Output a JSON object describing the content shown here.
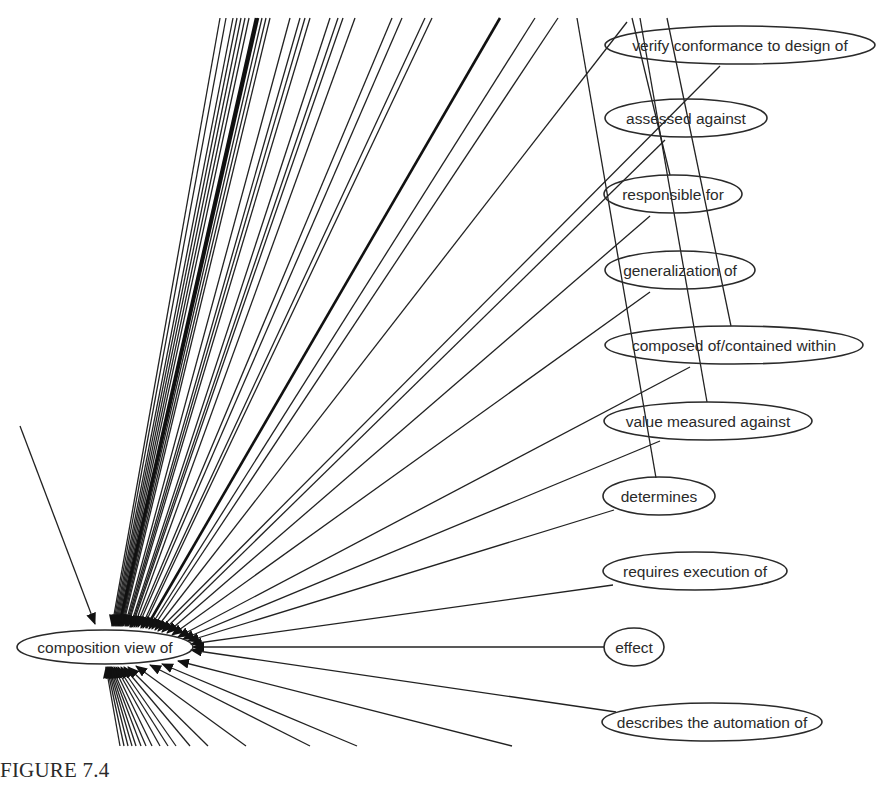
{
  "figure": {
    "caption": "FIGURE 7.4",
    "hub_node": {
      "id": "hub",
      "label": "composition view of",
      "cx": 105,
      "cy": 647,
      "rx": 88,
      "ry": 17
    },
    "nodes": [
      {
        "id": "verify",
        "label": "verify conformance to design of",
        "cx": 740,
        "cy": 45,
        "rx": 135,
        "ry": 19
      },
      {
        "id": "assessed",
        "label": "assessed against",
        "cx": 686,
        "cy": 118,
        "rx": 81,
        "ry": 19
      },
      {
        "id": "responsible",
        "label": "responsible for",
        "cx": 673,
        "cy": 194,
        "rx": 69,
        "ry": 19
      },
      {
        "id": "generalization",
        "label": "generalization of",
        "cx": 680,
        "cy": 270,
        "rx": 75,
        "ry": 19
      },
      {
        "id": "composed",
        "label": "composed of/contained within",
        "cx": 734,
        "cy": 345,
        "rx": 129,
        "ry": 19
      },
      {
        "id": "value",
        "label": "value measured against",
        "cx": 708,
        "cy": 421,
        "rx": 104,
        "ry": 19
      },
      {
        "id": "determines",
        "label": "determines",
        "cx": 659,
        "cy": 496,
        "rx": 56,
        "ry": 19
      },
      {
        "id": "requires",
        "label": "requires execution of",
        "cx": 695,
        "cy": 571,
        "rx": 92,
        "ry": 19
      },
      {
        "id": "effect",
        "label": "effect",
        "cx": 634,
        "cy": 647,
        "rx": 30,
        "ry": 19
      },
      {
        "id": "describes",
        "label": "describes the automation of",
        "cx": 712,
        "cy": 722,
        "rx": 110,
        "ry": 19
      }
    ],
    "edges_to_hub": [
      {
        "x1": 220,
        "y1": 18,
        "x2": 112,
        "y2": 626
      },
      {
        "x1": 226,
        "y1": 18,
        "x2": 113,
        "y2": 626
      },
      {
        "x1": 233,
        "y1": 18,
        "x2": 114,
        "y2": 626
      },
      {
        "x1": 237,
        "y1": 18,
        "x2": 115,
        "y2": 626
      },
      {
        "x1": 241,
        "y1": 18,
        "x2": 116,
        "y2": 626
      },
      {
        "x1": 245,
        "y1": 18,
        "x2": 117,
        "y2": 626
      },
      {
        "x1": 249,
        "y1": 18,
        "x2": 118,
        "y2": 626
      },
      {
        "x1": 256,
        "y1": 18,
        "x2": 119,
        "y2": 626,
        "thick": true
      },
      {
        "x1": 258,
        "y1": 18,
        "x2": 120,
        "y2": 626,
        "thick": true
      },
      {
        "x1": 262,
        "y1": 18,
        "x2": 121,
        "y2": 626
      },
      {
        "x1": 266,
        "y1": 18,
        "x2": 122,
        "y2": 626
      },
      {
        "x1": 270,
        "y1": 18,
        "x2": 123,
        "y2": 626
      },
      {
        "x1": 290,
        "y1": 18,
        "x2": 125,
        "y2": 626
      },
      {
        "x1": 300,
        "y1": 18,
        "x2": 126,
        "y2": 626
      },
      {
        "x1": 305,
        "y1": 18,
        "x2": 127,
        "y2": 626
      },
      {
        "x1": 310,
        "y1": 18,
        "x2": 128,
        "y2": 626
      },
      {
        "x1": 330,
        "y1": 18,
        "x2": 130,
        "y2": 627
      },
      {
        "x1": 338,
        "y1": 18,
        "x2": 131,
        "y2": 627
      },
      {
        "x1": 343,
        "y1": 18,
        "x2": 132,
        "y2": 627
      },
      {
        "x1": 355,
        "y1": 18,
        "x2": 134,
        "y2": 627
      },
      {
        "x1": 392,
        "y1": 18,
        "x2": 136,
        "y2": 627
      },
      {
        "x1": 402,
        "y1": 18,
        "x2": 138,
        "y2": 627
      },
      {
        "x1": 425,
        "y1": 18,
        "x2": 141,
        "y2": 628
      },
      {
        "x1": 432,
        "y1": 18,
        "x2": 143,
        "y2": 628
      },
      {
        "x1": 500,
        "y1": 18,
        "x2": 146,
        "y2": 628,
        "thick": true
      },
      {
        "x1": 535,
        "y1": 18,
        "x2": 149,
        "y2": 629
      },
      {
        "x1": 558,
        "y1": 18,
        "x2": 152,
        "y2": 629
      },
      {
        "x1": 627,
        "y1": 22,
        "x2": 155,
        "y2": 630
      },
      {
        "x1": 720,
        "y1": 66,
        "x2": 158,
        "y2": 631
      },
      {
        "x1": 665,
        "y1": 140,
        "x2": 162,
        "y2": 632
      },
      {
        "x1": 650,
        "y1": 216,
        "x2": 167,
        "y2": 633
      },
      {
        "x1": 650,
        "y1": 292,
        "x2": 172,
        "y2": 635
      },
      {
        "x1": 690,
        "y1": 367,
        "x2": 178,
        "y2": 637
      },
      {
        "x1": 660,
        "y1": 441,
        "x2": 183,
        "y2": 639
      },
      {
        "x1": 614,
        "y1": 510,
        "x2": 188,
        "y2": 641
      },
      {
        "x1": 613,
        "y1": 585,
        "x2": 191,
        "y2": 644
      },
      {
        "x1": 604,
        "y1": 647,
        "x2": 193,
        "y2": 647
      },
      {
        "x1": 616,
        "y1": 712,
        "x2": 191,
        "y2": 650
      },
      {
        "x1": 20,
        "y1": 426,
        "x2": 95,
        "y2": 624
      }
    ],
    "edges_below_hub": [
      {
        "x1": 120,
        "y1": 746,
        "x2": 106,
        "y2": 667
      },
      {
        "x1": 124,
        "y1": 746,
        "x2": 107,
        "y2": 667
      },
      {
        "x1": 128,
        "y1": 746,
        "x2": 108,
        "y2": 667
      },
      {
        "x1": 132,
        "y1": 746,
        "x2": 109,
        "y2": 667
      },
      {
        "x1": 136,
        "y1": 746,
        "x2": 110,
        "y2": 667
      },
      {
        "x1": 141,
        "y1": 746,
        "x2": 111,
        "y2": 667
      },
      {
        "x1": 146,
        "y1": 746,
        "x2": 112,
        "y2": 667
      },
      {
        "x1": 152,
        "y1": 746,
        "x2": 114,
        "y2": 667
      },
      {
        "x1": 160,
        "y1": 746,
        "x2": 116,
        "y2": 667
      },
      {
        "x1": 168,
        "y1": 746,
        "x2": 118,
        "y2": 667
      },
      {
        "x1": 176,
        "y1": 746,
        "x2": 121,
        "y2": 667
      },
      {
        "x1": 190,
        "y1": 746,
        "x2": 124,
        "y2": 667
      },
      {
        "x1": 208,
        "y1": 746,
        "x2": 128,
        "y2": 667
      },
      {
        "x1": 246,
        "y1": 746,
        "x2": 136,
        "y2": 666
      },
      {
        "x1": 310,
        "y1": 746,
        "x2": 150,
        "y2": 665
      },
      {
        "x1": 357,
        "y1": 746,
        "x2": 162,
        "y2": 664
      },
      {
        "x1": 512,
        "y1": 746,
        "x2": 178,
        "y2": 661
      }
    ],
    "edges_between_nodes": [
      {
        "x1": 577,
        "y1": 18,
        "x2": 656,
        "y2": 478
      },
      {
        "x1": 632,
        "y1": 18,
        "x2": 670,
        "y2": 175
      },
      {
        "x1": 640,
        "y1": 18,
        "x2": 707,
        "y2": 402
      },
      {
        "x1": 667,
        "y1": 18,
        "x2": 731,
        "y2": 326
      }
    ]
  }
}
